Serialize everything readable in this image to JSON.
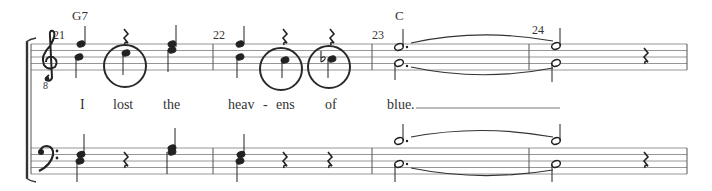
{
  "score": {
    "system": {
      "staves": [
        {
          "name": "treble",
          "clef": "treble-8vb",
          "octave_marker": "8"
        },
        {
          "name": "bass",
          "clef": "bass"
        }
      ]
    },
    "measures": [
      {
        "number": "21",
        "chord": "G7"
      },
      {
        "number": "22",
        "chord": ""
      },
      {
        "number": "23",
        "chord": "C"
      },
      {
        "number": "24",
        "chord": ""
      }
    ],
    "lyrics": [
      {
        "text": "I"
      },
      {
        "text": "lost"
      },
      {
        "text": "the"
      },
      {
        "text": "heav"
      },
      {
        "text": "-"
      },
      {
        "text": "ens"
      },
      {
        "text": "of"
      },
      {
        "text": "blue."
      }
    ],
    "annotations": {
      "circled_notes": 3,
      "accidental": "flat"
    },
    "colors": {
      "ink": "#222222",
      "staff_line": "#8a8a8a",
      "circle": "#2a2a2a"
    }
  }
}
